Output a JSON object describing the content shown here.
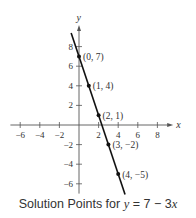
{
  "chart_data": {
    "type": "line",
    "title": "Solution Points for y = 7 − 3x",
    "caption": {
      "prefix": "Solution Points for ",
      "var_y": "y",
      "equals": " = 7 − 3",
      "var_x": "x"
    },
    "equation": {
      "slope": -3,
      "intercept": 7
    },
    "xlabel": "x",
    "ylabel": "y",
    "xlim": [
      -7,
      9
    ],
    "ylim": [
      -7,
      9.5
    ],
    "x_ticks": [
      -6,
      -4,
      -2,
      2,
      4,
      6,
      8
    ],
    "y_ticks": [
      -6,
      -4,
      -2,
      2,
      4,
      6,
      8
    ],
    "x_tick_labels": [
      "−6",
      "−4",
      "−2",
      "2",
      "4",
      "6",
      "8"
    ],
    "y_tick_labels": [
      "−6",
      "−4",
      "−2",
      "2",
      "4",
      "6",
      "8"
    ],
    "grid": false,
    "line_segment": {
      "x_start": -0.8,
      "x_end": 4.7
    },
    "points": [
      {
        "x": 0,
        "y": 7,
        "label": "(0, 7)"
      },
      {
        "x": 1,
        "y": 4,
        "label": "(1, 4)"
      },
      {
        "x": 2,
        "y": 1,
        "label": "(2, 1)"
      },
      {
        "x": 3,
        "y": -2,
        "label": "(3, −2)"
      },
      {
        "x": 4,
        "y": -5,
        "label": "(4, −5)"
      }
    ],
    "colors": {
      "axis": "#555555",
      "line": "#111111",
      "text": "#333333"
    }
  }
}
